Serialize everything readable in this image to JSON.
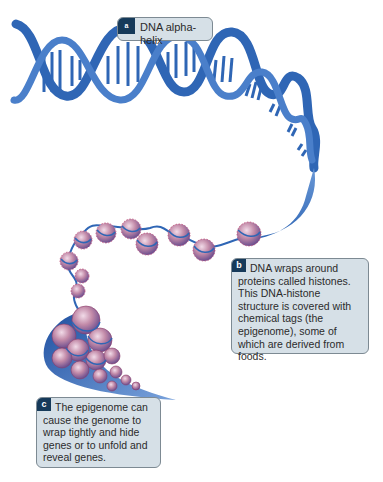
{
  "diagram": {
    "colors": {
      "dna_blue": "#2f66b5",
      "dna_light": "#6a98d6",
      "histone_pink": "#c28aa8",
      "histone_purple": "#7a5a9e",
      "callout_bg": "#d6e0e7",
      "callout_border": "#7d8a93",
      "badge_bg": "#163a5a"
    },
    "callouts": [
      {
        "id": "a",
        "badge": "a",
        "text": "DNA alpha-helix"
      },
      {
        "id": "b",
        "badge": "b",
        "text": "DNA wraps around proteins called histones. This DNA-histone structure is covered with chemical tags (the epigenome), some of which are derived from foods."
      },
      {
        "id": "c",
        "badge": "c",
        "text": "The epigenome can cause the genome to wrap tightly and hide genes or to unfold and reveal genes."
      }
    ],
    "elements": [
      {
        "name": "double-helix",
        "label": "DNA double helix strand"
      },
      {
        "name": "nucleosome-chain",
        "label": "Histone beads on DNA string"
      },
      {
        "name": "condensed-chromatin",
        "label": "Tightly packed chromatin"
      }
    ]
  }
}
